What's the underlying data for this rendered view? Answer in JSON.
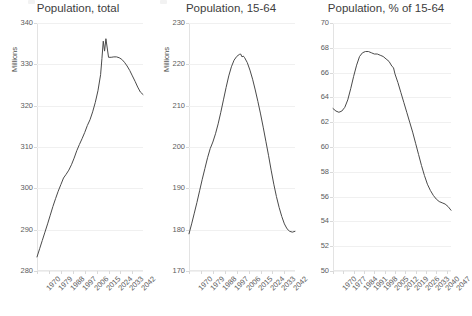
{
  "figure": {
    "width": 464,
    "height": 316,
    "background": "#ffffff",
    "line_color": "#4a4a4a",
    "grid_color": "#f0f0f0",
    "text_color": "#5c5c5c"
  },
  "chart_data": [
    {
      "type": "line",
      "title": "Population, total",
      "xlabel": "",
      "ylabel": "Millions",
      "grid": true,
      "legend": "none",
      "xlim": [
        1970,
        2050
      ],
      "ylim": [
        280,
        340
      ],
      "xticks": [
        "1970",
        "1979",
        "1988",
        "1997",
        "2006",
        "2015",
        "2024",
        "2033",
        "2042"
      ],
      "xtick_values": [
        1970,
        1979,
        1988,
        1997,
        2006,
        2015,
        2024,
        2033,
        2042
      ],
      "yticks": [
        "280",
        "290",
        "300",
        "310",
        "320",
        "330",
        "340"
      ],
      "ytick_values": [
        280,
        290,
        300,
        310,
        320,
        330,
        340
      ],
      "x": [
        1970,
        1972,
        1974,
        1976,
        1978,
        1980,
        1982,
        1984,
        1986,
        1988,
        1990,
        1992,
        1994,
        1996,
        1998,
        2000,
        2002,
        2004,
        2006,
        2008,
        2010,
        2012,
        2014,
        2016,
        2018,
        2019,
        2020,
        2021,
        2022,
        2024,
        2026,
        2028,
        2030,
        2032,
        2034,
        2036,
        2038,
        2040,
        2042,
        2044,
        2046,
        2048,
        2050
      ],
      "y": [
        283.4,
        285.4,
        287.4,
        289.4,
        291.4,
        293.5,
        295.6,
        297.5,
        299.3,
        300.9,
        302.5,
        303.4,
        304.4,
        305.7,
        307.3,
        309.1,
        310.6,
        312.0,
        313.5,
        315.2,
        316.6,
        318.5,
        320.8,
        323.6,
        327.5,
        331.4,
        335.6,
        333.2,
        336.2,
        331.7,
        331.7,
        331.8,
        331.8,
        331.6,
        331.2,
        330.5,
        329.6,
        328.5,
        327.2,
        325.9,
        324.5,
        323.3,
        322.7
      ]
    },
    {
      "type": "line",
      "title": "Population, 15-64",
      "xlabel": "",
      "ylabel": "Millions",
      "grid": true,
      "legend": "none",
      "xlim": [
        1970,
        2050
      ],
      "ylim": [
        170,
        230
      ],
      "xticks": [
        "1970",
        "1979",
        "1988",
        "1997",
        "2006",
        "2015",
        "2024",
        "2033",
        "2042"
      ],
      "xtick_values": [
        1970,
        1979,
        1988,
        1997,
        2006,
        2015,
        2024,
        2033,
        2042
      ],
      "yticks": [
        "170",
        "180",
        "190",
        "200",
        "210",
        "220",
        "230"
      ],
      "ytick_values": [
        170,
        180,
        190,
        200,
        210,
        220,
        230
      ],
      "x": [
        1970,
        1972,
        1974,
        1976,
        1978,
        1980,
        1982,
        1984,
        1986,
        1988,
        1990,
        1992,
        1994,
        1996,
        1998,
        2000,
        2002,
        2004,
        2006,
        2008,
        2009,
        2010,
        2011,
        2012,
        2014,
        2016,
        2018,
        2020,
        2022,
        2024,
        2026,
        2028,
        2030,
        2032,
        2034,
        2036,
        2038,
        2040,
        2042,
        2044,
        2046,
        2048,
        2050
      ],
      "y": [
        179.0,
        181.4,
        184.0,
        186.6,
        189.4,
        192.2,
        194.8,
        197.4,
        199.6,
        201.2,
        203.2,
        205.6,
        208.4,
        211.4,
        214.4,
        217.2,
        219.4,
        221.0,
        221.9,
        222.4,
        222.5,
        221.8,
        222.0,
        221.6,
        220.4,
        218.6,
        216.4,
        213.8,
        211.0,
        208.0,
        204.8,
        201.4,
        198.0,
        194.4,
        191.0,
        188.0,
        185.4,
        183.2,
        181.4,
        180.2,
        179.6,
        179.4,
        179.6
      ]
    },
    {
      "type": "line",
      "title": "Population, % of 15-64",
      "xlabel": "",
      "ylabel": "",
      "grid": true,
      "legend": "none",
      "xlim": [
        1970,
        2050
      ],
      "ylim": [
        50,
        70
      ],
      "xticks": [
        "1970",
        "1977",
        "1984",
        "1991",
        "1998",
        "2005",
        "2012",
        "2019",
        "2026",
        "2033",
        "2040",
        "2047"
      ],
      "xtick_values": [
        1970,
        1977,
        1984,
        1991,
        1998,
        2005,
        2012,
        2019,
        2026,
        2033,
        2040,
        2047
      ],
      "yticks": [
        "50",
        "52",
        "54",
        "56",
        "58",
        "60",
        "62",
        "64",
        "66",
        "68",
        "70"
      ],
      "ytick_values": [
        50,
        52,
        54,
        56,
        58,
        60,
        62,
        64,
        66,
        68,
        70
      ],
      "x": [
        1970,
        1972,
        1974,
        1976,
        1978,
        1980,
        1982,
        1984,
        1986,
        1988,
        1990,
        1992,
        1994,
        1996,
        1998,
        2000,
        2002,
        2004,
        2006,
        2008,
        2010,
        2011,
        2012,
        2014,
        2016,
        2018,
        2020,
        2022,
        2024,
        2026,
        2028,
        2030,
        2032,
        2034,
        2036,
        2038,
        2040,
        2042,
        2044,
        2046,
        2048,
        2050
      ],
      "y": [
        63.1,
        62.9,
        62.8,
        62.9,
        63.2,
        63.8,
        64.7,
        65.7,
        66.6,
        67.3,
        67.6,
        67.7,
        67.7,
        67.6,
        67.5,
        67.5,
        67.4,
        67.3,
        67.1,
        66.9,
        66.5,
        66.4,
        65.9,
        65.2,
        64.4,
        63.6,
        62.8,
        62.0,
        61.2,
        60.3,
        59.4,
        58.5,
        57.7,
        57.0,
        56.5,
        56.1,
        55.8,
        55.6,
        55.5,
        55.4,
        55.2,
        54.9
      ]
    }
  ]
}
